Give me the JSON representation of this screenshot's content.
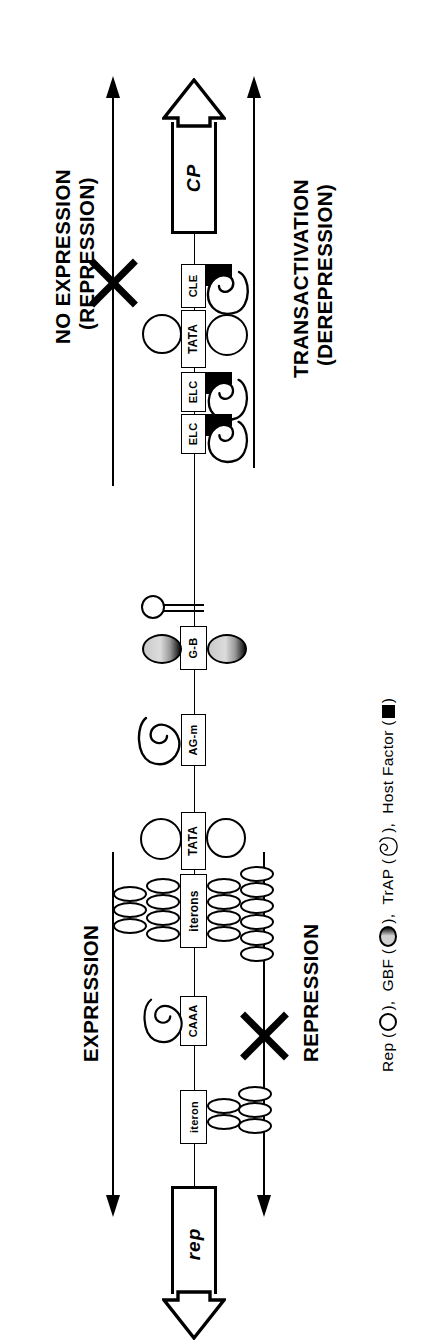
{
  "figure": {
    "type": "diagram",
    "orientation": "rotated 90 degrees counter-clockwise"
  },
  "panels": {
    "top": {
      "outcome_label_line1": "NO EXPRESSION",
      "outcome_label_line2": "(REPRESSION)",
      "blocked": true,
      "outcome2_label_line1": "TRANSACTIVATION",
      "outcome2_label_line2": "(DEREPRESSION)",
      "blocked2": false
    },
    "bottom": {
      "outcome_label_line1": "EXPRESSION",
      "blocked": false,
      "outcome2_label_line1": "REPRESSION",
      "blocked2": true
    }
  },
  "genes": [
    {
      "name": "CP",
      "direction": "up"
    },
    {
      "name": "rep",
      "direction": "down"
    }
  ],
  "promoter_elements": [
    {
      "id": "cle",
      "label": "CLE"
    },
    {
      "id": "tata-cp",
      "label": "TATA"
    },
    {
      "id": "elc-1",
      "label": "ELC"
    },
    {
      "id": "elc-2",
      "label": "ELC"
    },
    {
      "id": "g-box",
      "label": "G-B"
    },
    {
      "id": "ag-motif",
      "label": "AG-m"
    },
    {
      "id": "tata-rep",
      "label": "TATA"
    },
    {
      "id": "iterons",
      "label": "iterons"
    },
    {
      "id": "caaa",
      "label": "CAAA"
    },
    {
      "id": "iteron",
      "label": "iteron"
    }
  ],
  "legend": {
    "full_text": "Rep ( ○ ), GBF ( ◕ ), TrAP ( ⊂ ), Host Factor ( ■ )",
    "items": [
      {
        "name": "Rep",
        "symbol": "open-circle",
        "text_before": "Rep (",
        "text_after": "),"
      },
      {
        "name": "GBF",
        "symbol": "half-shaded-oval",
        "text_before": "GBF (",
        "text_after": "),"
      },
      {
        "name": "TrAP",
        "symbol": "crescent-outline",
        "text_before": "TrAP (",
        "text_after": "),"
      },
      {
        "name": "Host Factor",
        "symbol": "filled-square",
        "text_before": "Host Factor (",
        "text_after": ")"
      }
    ]
  },
  "colors": {
    "ink": "#000000",
    "paper": "#ffffff",
    "gbf_shade_light": "#d3d3d3",
    "gbf_shade_dark": "#111111"
  }
}
